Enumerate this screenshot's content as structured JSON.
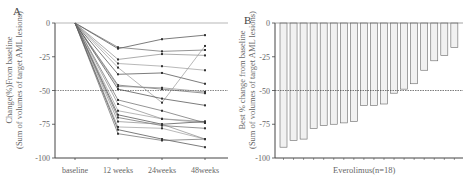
{
  "chart_data": [
    {
      "panel": "A",
      "type": "line",
      "title": "",
      "xlabel": "",
      "ylabel": "Change(%)From baseline (Sum of volumes of target AML lesions)",
      "ylabel_lines": [
        "Change(%)From baseline",
        "(Sum of volumes of target AML lesions)"
      ],
      "categories": [
        "baseline",
        "12 weeks",
        "24weeks",
        "48weeks"
      ],
      "yticks": [
        0,
        -25,
        -50,
        -75,
        -100
      ],
      "ytick_labels": [
        "0",
        "-25",
        "-50",
        "-75",
        "-100"
      ],
      "ylim": [
        -100,
        0
      ],
      "reference_lines": [
        0,
        -50
      ],
      "grid": false,
      "series": [
        {
          "name": "patient 1",
          "values": [
            0,
            -19,
            -12,
            -9
          ]
        },
        {
          "name": "patient 2",
          "values": [
            0,
            -18,
            -21,
            -20
          ]
        },
        {
          "name": "patient 3",
          "values": [
            0,
            -27,
            -23,
            -24
          ]
        },
        {
          "name": "patient 4",
          "values": [
            0,
            -30,
            -32,
            -35
          ]
        },
        {
          "name": "patient 5",
          "values": [
            0,
            -38,
            -37,
            -45
          ]
        },
        {
          "name": "patient 6",
          "values": [
            0,
            -46,
            -49,
            -52
          ]
        },
        {
          "name": "patient 7",
          "values": [
            0,
            -47,
            -48,
            -51
          ]
        },
        {
          "name": "patient 8",
          "values": [
            0,
            -33,
            -59,
            -17
          ]
        },
        {
          "name": "patient 9",
          "values": [
            0,
            -49,
            -56,
            -61
          ]
        },
        {
          "name": "patient 10",
          "values": [
            0,
            -57,
            -65,
            -74
          ]
        },
        {
          "name": "patient 11",
          "values": [
            0,
            -60,
            -71,
            -73
          ]
        },
        {
          "name": "patient 12",
          "values": [
            0,
            -65,
            -71,
            -74
          ]
        },
        {
          "name": "patient 13",
          "values": [
            0,
            -68,
            -75,
            -73
          ]
        },
        {
          "name": "patient 14",
          "values": [
            0,
            -70,
            -76,
            -78
          ]
        },
        {
          "name": "patient 15",
          "values": [
            0,
            -73,
            -75,
            -86
          ]
        },
        {
          "name": "patient 16",
          "values": [
            0,
            -77,
            -78,
            -86
          ]
        },
        {
          "name": "patient 17",
          "values": [
            0,
            -79,
            -86,
            -92
          ]
        },
        {
          "name": "patient 18",
          "values": [
            0,
            -82,
            -87,
            -86
          ]
        }
      ]
    },
    {
      "panel": "B",
      "type": "bar",
      "title": "",
      "xlabel": "Everolimus(n=18)",
      "ylabel": "Best % change from baseline (Sum of volumes of target AML lesions)",
      "ylabel_lines": [
        "Best % change from baseline",
        "(Sum of volumes of target AML lesions)"
      ],
      "categories": [
        "1",
        "2",
        "3",
        "4",
        "5",
        "6",
        "7",
        "8",
        "9",
        "10",
        "11",
        "12",
        "13",
        "14",
        "15",
        "16",
        "17",
        "18"
      ],
      "values": [
        -92,
        -87,
        -86,
        -78,
        -76,
        -75,
        -74,
        -73,
        -61,
        -61,
        -60,
        -52,
        -49,
        -45,
        -35,
        -28,
        -24,
        -18
      ],
      "yticks": [
        0,
        -25,
        -50,
        -75,
        -100
      ],
      "ytick_labels": [
        "0",
        "-25",
        "-50",
        "-75",
        "-100"
      ],
      "ylim": [
        -100,
        0
      ],
      "reference_lines": [
        -50
      ],
      "grid": false
    }
  ],
  "panels": {
    "a": {
      "letter": "A",
      "ylabel_line1": "Change(%)From baseline",
      "ylabel_line2": "(Sum of volumes of target AML lesions)"
    },
    "b": {
      "letter": "B",
      "ylabel_line1": "Best % change from baseline",
      "ylabel_line2": "(Sum of volumes of target AML lesions)",
      "xlabel": "Everolimus(n=18)"
    }
  }
}
